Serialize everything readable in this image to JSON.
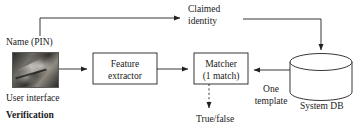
{
  "diagram": {
    "type": "biometric-verification-block-diagram",
    "caption": "Verification",
    "colors": {
      "stroke": "#231f20",
      "text": "#1a1a1a",
      "background": "#ffffff"
    },
    "blocks": [
      {
        "id": "feature-extractor",
        "shape": "rectangle",
        "line1": "Feature",
        "line2": "extractor"
      },
      {
        "id": "matcher",
        "shape": "rectangle",
        "line1": "Matcher",
        "line2": "(1 match)"
      },
      {
        "id": "system-db",
        "shape": "cylinder",
        "label": "System DB"
      }
    ],
    "labels": {
      "claimed_identity_line1": "Claimed",
      "claimed_identity_line2": "identity",
      "name_pin": "Name (PIN)",
      "user_interface": "User interface",
      "verification": "Verification",
      "true_false": "True/false",
      "one_template_line1": "One",
      "one_template_line2": "template",
      "system_db": "System DB"
    },
    "thumbnail": {
      "id": "user-interface-capture",
      "description": "grayscale photo of finger on sensor"
    },
    "edges": [
      {
        "from": "name-pin-input",
        "to": "claimed-identity",
        "style": "solid",
        "arrow": "end"
      },
      {
        "from": "claimed-identity",
        "to": "system-db",
        "style": "solid",
        "arrow": "end"
      },
      {
        "from": "user-interface-capture",
        "to": "feature-extractor",
        "style": "solid",
        "arrow": "end"
      },
      {
        "from": "feature-extractor",
        "to": "matcher",
        "style": "solid",
        "arrow": "end"
      },
      {
        "from": "system-db",
        "to": "matcher",
        "style": "solid",
        "arrow": "end",
        "label": "One template"
      },
      {
        "from": "matcher",
        "to": "true-false",
        "style": "dashed",
        "arrow": "end"
      }
    ]
  }
}
